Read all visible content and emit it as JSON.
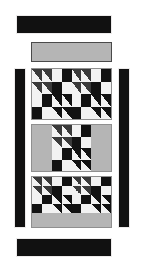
{
  "diagram": {
    "canvas": {
      "width": 143,
      "height": 261,
      "background": "#ffffff"
    },
    "palette": {
      "dark": "#121212",
      "triangle_dark": "#3a3a3a",
      "light": "#f2f2f2",
      "medium_gray": "#b5b5b5",
      "frame": "#8f8f8f"
    },
    "borders": {
      "top_bar": {
        "label": "top border strip",
        "color": "#111111",
        "x": 16,
        "y": 15,
        "w": 96,
        "h": 19
      },
      "bottom_bar": {
        "label": "bottom border strip",
        "color": "#111111",
        "x": 16,
        "y": 238,
        "w": 96,
        "h": 19
      },
      "left_bar": {
        "label": "left border strip",
        "color": "#111111",
        "x": 14,
        "y": 68,
        "w": 12,
        "h": 160
      },
      "right_bar": {
        "label": "right border strip",
        "color": "#111111",
        "x": 118,
        "y": 68,
        "w": 12,
        "h": 160
      }
    },
    "top_sash": {
      "label": "top sashing strip",
      "color": "#b5b5b5",
      "x": 31,
      "y": 42,
      "w": 81,
      "h": 20
    },
    "rows": [
      {
        "name": "row-1",
        "x": 31,
        "y": 68,
        "w": 81,
        "h": 52,
        "segments": [
          {
            "type": "block",
            "pattern": "double-four-patch",
            "flex": 1
          },
          {
            "type": "block",
            "pattern": "double-four-patch",
            "flex": 1
          }
        ]
      },
      {
        "name": "row-2",
        "x": 31,
        "y": 124,
        "w": 81,
        "h": 48,
        "segments": [
          {
            "type": "sash",
            "color": "#b5b5b5",
            "flex": 1
          },
          {
            "type": "block",
            "pattern": "double-four-patch",
            "flex": 2
          },
          {
            "type": "sash",
            "color": "#b5b5b5",
            "flex": 1
          }
        ]
      },
      {
        "name": "row-3",
        "x": 31,
        "y": 176,
        "w": 81,
        "h": 52,
        "segments": [
          {
            "type": "block",
            "pattern": "double-four-patch",
            "flex": 1
          },
          {
            "type": "block",
            "pattern": "double-four-patch",
            "flex": 1
          }
        ],
        "footer_sash": {
          "color": "#b5b5b5",
          "height": 14
        }
      }
    ],
    "block_pattern": {
      "name": "double-four-patch",
      "grid": [
        4,
        4
      ],
      "legend": [
        {
          "code": "hst-br",
          "meaning": "half-square triangle, dark lower-left"
        },
        {
          "code": "hstk-bl",
          "meaning": "half-square triangle, light lower-left on dark"
        },
        {
          "code": "white",
          "meaning": "light square"
        },
        {
          "code": "black",
          "meaning": "dark square"
        }
      ],
      "cells": [
        [
          "hst-br",
          "hst-br",
          "white",
          "black"
        ],
        [
          "hst-br",
          "hst-br",
          "black",
          "white"
        ],
        [
          "white",
          "black",
          "hstk-bl",
          "hstk-bl"
        ],
        [
          "black",
          "white",
          "hstk-bl",
          "hstk-bl"
        ]
      ]
    }
  }
}
